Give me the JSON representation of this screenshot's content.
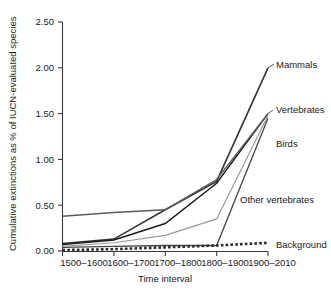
{
  "chart_data": {
    "type": "line",
    "title": "",
    "xlabel": "Time interval",
    "ylabel": "Cumulative extinctions as % of IUCN-evaluated species",
    "categories": [
      "1500–1600",
      "1600–1700",
      "1700–1800",
      "1800–1900",
      "1900–2010"
    ],
    "ylim": [
      0.0,
      2.5
    ],
    "yticks": [
      "0.00",
      "0.50",
      "1.00",
      "1.50",
      "2.00",
      "2.50"
    ],
    "ytick_values": [
      0.0,
      0.5,
      1.0,
      1.5,
      2.0,
      2.5
    ],
    "grid": false,
    "legend_position": "inline-right-labels",
    "series": [
      {
        "name": "Mammals",
        "label": "Mammals",
        "values": [
          0.08,
          0.13,
          0.45,
          0.76,
          2.0
        ],
        "color": "#333333",
        "style": "solid",
        "width": 1.6
      },
      {
        "name": "Vertebrates",
        "label": "Vertebrates",
        "values": [
          0.07,
          0.12,
          0.3,
          0.74,
          1.5
        ],
        "color": "#1a1a1a",
        "style": "solid",
        "width": 1.4
      },
      {
        "name": "Birds",
        "label": "Birds",
        "values": [
          0.04,
          0.05,
          0.06,
          0.06,
          1.45
        ],
        "color": "#444444",
        "style": "solid",
        "width": 1.3
      },
      {
        "name": "Other vertebrates",
        "label": "Other vertebrates",
        "values": [
          0.38,
          0.42,
          0.45,
          0.78,
          1.5
        ],
        "color": "#5a5a5a",
        "style": "solid",
        "width": 1.4
      },
      {
        "name": "Other vertebrates lower",
        "label": "",
        "values": [
          0.05,
          0.09,
          0.17,
          0.35,
          1.48
        ],
        "color": "#9a9a9a",
        "style": "solid",
        "width": 1.2
      },
      {
        "name": "Background",
        "label": "Background",
        "values": [
          0.01,
          0.02,
          0.04,
          0.06,
          0.09
        ],
        "color": "#2a2a2a",
        "style": "dotted",
        "width": 2.6
      }
    ]
  },
  "labels": {
    "mammals": "Mammals",
    "vertebrates": "Vertebrates",
    "birds": "Birds",
    "other_vertebrates": "Other vertebrates",
    "background": "Background",
    "y_axis_title": "Cumulative extinctions as % of IUCN-evaluated species",
    "x_axis_title": "Time interval",
    "ytick_0": "0.00",
    "ytick_1": "0.50",
    "ytick_2": "1.00",
    "ytick_3": "1.50",
    "ytick_4": "2.00",
    "ytick_5": "2.50",
    "xtick_0": "1500–1600",
    "xtick_1": "1600–1700",
    "xtick_2": "1700–1800",
    "xtick_3": "1800–1900",
    "xtick_4": "1900–2010"
  }
}
